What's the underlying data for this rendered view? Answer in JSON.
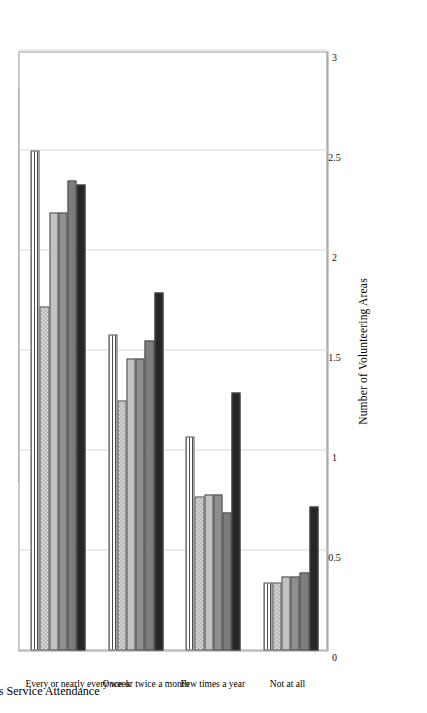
{
  "chart_data": {
    "type": "bar",
    "orientation": "horizontal",
    "title": "",
    "xlabel": "Religious Service Attendance",
    "ylabel": "Number of Volunteering Areas",
    "ylim": [
      0,
      3
    ],
    "yticks": [
      "0",
      "0.5",
      "1",
      "1.5",
      "2",
      "2.5",
      "3"
    ],
    "grid": true,
    "legend_position": "left-outside",
    "categories": [
      "Not at all",
      "Few times a year",
      "Once or twice a month",
      "Every or nearly every week"
    ],
    "series": [
      {
        "name": "Liberal Protestant",
        "fill": "solid-near-black",
        "color": "#262626",
        "values": [
          0.72,
          1.29,
          1.79,
          2.33
        ]
      },
      {
        "name": "Mainline Protestant",
        "fill": "solid-dark-gray",
        "color": "#7d7d7d",
        "values": [
          0.39,
          0.69,
          1.55,
          2.35
        ]
      },
      {
        "name": "Evangelical Protestant",
        "fill": "solid-mid-gray",
        "color": "#8f8f8f",
        "values": [
          0.37,
          0.78,
          1.46,
          2.19
        ]
      },
      {
        "name": "Catholic",
        "fill": "solid-light-gray",
        "color": "#c2c2c2",
        "values": [
          0.37,
          0.78,
          1.46,
          2.19
        ]
      },
      {
        "name": "Jewish",
        "fill": "checkered",
        "color": "#9b9b9b",
        "values": [
          0.34,
          0.77,
          1.25,
          1.72
        ]
      },
      {
        "name": "Other denomination/religion",
        "fill": "horizontal-stripes",
        "color": "#4a4a4a",
        "values": [
          0.34,
          1.07,
          1.58,
          2.5
        ]
      }
    ]
  },
  "legend": {
    "rows": [
      [
        "Liberal Protestant",
        "Mainline Protestant",
        "Evangelical Protestant"
      ],
      [
        "Catholic",
        "Jewish",
        "Other denomination/religion"
      ]
    ]
  }
}
